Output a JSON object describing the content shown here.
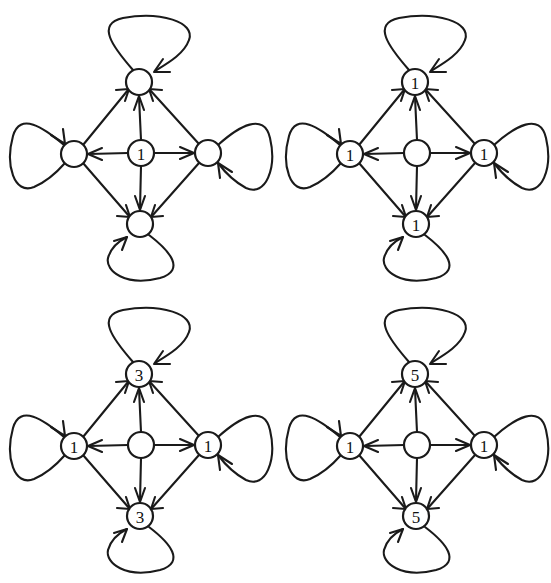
{
  "figure": {
    "background_color": "#ffffff",
    "stroke_color": "#1a1a1a",
    "panel_count": 4,
    "panel_layout": "2x2"
  },
  "diagram_data": {
    "type": "diagram",
    "description": "Four directed graph diagrams arranged in a 2x2 grid. Each diagram is a diamond-shaped digraph with one center node and four outer nodes (top, left, right, bottom). Every outer node has a self-loop. Node labels differ between panels.",
    "node_positions": {
      "center": [
        141,
        153
      ],
      "top": [
        139,
        82
      ],
      "left": [
        74,
        154
      ],
      "right": [
        208,
        153
      ],
      "bottom": [
        140,
        224
      ]
    },
    "node_radius": 13,
    "edges": [
      {
        "from": "center",
        "to": "top",
        "directed": true
      },
      {
        "from": "center",
        "to": "left",
        "directed": true
      },
      {
        "from": "center",
        "to": "right",
        "directed": true
      },
      {
        "from": "center",
        "to": "bottom",
        "directed": true
      },
      {
        "from": "left",
        "to": "top",
        "directed": true
      },
      {
        "from": "right",
        "to": "top",
        "directed": true
      },
      {
        "from": "left",
        "to": "bottom",
        "directed": true
      },
      {
        "from": "right",
        "to": "bottom",
        "directed": true
      }
    ],
    "self_loops": [
      "top",
      "left",
      "right",
      "bottom"
    ],
    "panels": [
      {
        "name": "panel-top-left",
        "position": "top-left",
        "labels": {
          "center": "1",
          "top": "",
          "left": "",
          "right": "",
          "bottom": ""
        }
      },
      {
        "name": "panel-top-right",
        "position": "top-right",
        "labels": {
          "center": "",
          "top": "1",
          "left": "1",
          "right": "1",
          "bottom": "1"
        }
      },
      {
        "name": "panel-bottom-left",
        "position": "bottom-left",
        "labels": {
          "center": "",
          "top": "3",
          "left": "1",
          "right": "1",
          "bottom": "3"
        }
      },
      {
        "name": "panel-bottom-right",
        "position": "bottom-right",
        "labels": {
          "center": "",
          "top": "5",
          "left": "1",
          "right": "1",
          "bottom": "5"
        }
      }
    ]
  }
}
